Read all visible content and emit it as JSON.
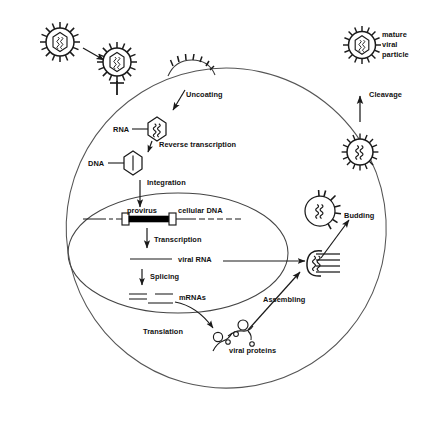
{
  "figure": {
    "type": "biological-process-diagram"
  },
  "labels": {
    "mature_viral_particle": "mature\nviral\nparticle",
    "mature_viral_particle_lines": [
      "mature",
      "viral",
      "particle"
    ],
    "cleavage": "Cleavage",
    "budding": "Budding",
    "uncoating": "Uncoating",
    "rna": "RNA",
    "reverse_transcription": "Reverse transcription",
    "dna": "DNA",
    "integration": "Integration",
    "provirus": "provirus",
    "cellular_dna": "cellular DNA",
    "transcription": "Transcription",
    "viral_rna": "viral RNA",
    "splicing": "Splicing",
    "mrnas": "mRNAs",
    "translation": "Translation",
    "assembling": "Assembling",
    "viral_proteins": "viral proteins"
  },
  "colors": {
    "stroke": "#1a1a1a",
    "membrane": "#555555",
    "nucleus": "#444444",
    "background": "#ffffff",
    "text": "#111111",
    "provirus_fill": "#000000"
  },
  "structures": {
    "free_virion": "enveloped virion with surface spikes and hexagonal capsid",
    "attached_virion": "virion bound to cell surface receptor",
    "entry_pore": "membrane bulge with spikes at fusion site",
    "capsid_rna": "hexagonal capsid containing RNA genome",
    "capsid_dna": "hexagonal capsid containing DNA",
    "cell_membrane": "plasma membrane circle",
    "nucleus_membrane": "nuclear envelope ellipse",
    "integrated_provirus": "provirus bar flanked by LTR boxes within cellular DNA",
    "spliced_mrnas": "three short mRNA segments",
    "viral_protein_chains": "polyprotein chains with globular domains",
    "assembly_site": "crescent assembly site at inner membrane with spikes",
    "budding_virion": "virion budding through plasma membrane",
    "immature_virion": "released immature particle without condensed core"
  }
}
